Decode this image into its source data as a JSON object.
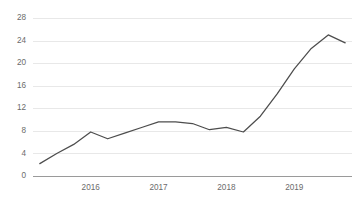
{
  "chart_data": {
    "type": "line",
    "title": "",
    "subtitle": "",
    "xlabel": "",
    "ylabel": "",
    "ylim": [
      0,
      28
    ],
    "yticks": [
      0,
      4,
      8,
      12,
      16,
      20,
      24,
      28
    ],
    "xticks": [
      "2016",
      "2017",
      "2018",
      "2019"
    ],
    "xtick_positions": [
      4,
      8,
      12,
      16
    ],
    "grid": true,
    "legend": false,
    "legend_position": "none",
    "series": [
      {
        "name": "Series 1",
        "color": "#4d4d4d",
        "x": [
          1,
          2,
          3,
          4,
          5,
          6,
          7,
          8,
          9,
          10,
          11,
          12,
          13,
          14,
          15,
          16,
          17,
          18,
          19
        ],
        "values": [
          2.2,
          4.0,
          5.6,
          7.8,
          6.6,
          7.6,
          8.6,
          9.6,
          9.6,
          9.3,
          8.2,
          8.6,
          7.8,
          10.6,
          14.6,
          19.0,
          22.6,
          25.0,
          23.6
        ]
      }
    ]
  },
  "colors": {
    "background": "#ffffff",
    "grid": "#e8e8e8",
    "axis": "#9a9a9a",
    "tick_text": "#6b6b6b",
    "line": "#4d4d4d"
  }
}
